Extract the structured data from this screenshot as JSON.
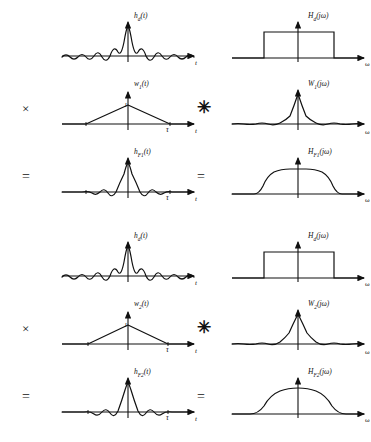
{
  "figure": {
    "domain_labels": {
      "time_axis": "t",
      "freq_axis": "ω",
      "window_duration_tick": "τ",
      "unit_amplitude": "1"
    },
    "operators": {
      "multiply": "×",
      "convolve": "✳",
      "equals": "="
    },
    "colors": {
      "background": "#ffffff",
      "curve": "#111111",
      "axis": "#111111",
      "text": "#111111"
    }
  },
  "blocks": [
    {
      "id": "block-1",
      "name": "window-1-long-duration",
      "rows": [
        {
          "id": "row-1-ideal",
          "operator_left": "",
          "operator_right": "",
          "left": {
            "label": "h",
            "label_sub": "d",
            "label_tail": "(t)",
            "axis": "t",
            "plot": "sinc"
          },
          "right": {
            "label": "H",
            "label_sub": "d",
            "label_tail": "(jω)",
            "axis": "ω",
            "plot": "ideal-brickwall"
          }
        },
        {
          "id": "row-2-window",
          "operator_left": "×",
          "operator_right": "✳",
          "left": {
            "label": "w",
            "label_sub": "1",
            "label_tail": "(t)",
            "axis": "t",
            "tick": "τ",
            "amplitude_label": "1",
            "plot": "triangular-window-wide"
          },
          "right": {
            "label": "W",
            "label_sub": "1",
            "label_tail": "(jω)",
            "axis": "ω",
            "plot": "window-spectrum-narrow"
          }
        },
        {
          "id": "row-3-result",
          "operator_left": "=",
          "operator_right": "=",
          "left": {
            "label": "h",
            "label_sub": "F1",
            "label_tail": "(t)",
            "axis": "t",
            "tick": "τ",
            "plot": "truncated-sinc-wide"
          },
          "right": {
            "label": "H",
            "label_sub": "F1",
            "label_tail": "(jω)",
            "axis": "ω",
            "plot": "smoothed-brickwall-sharp"
          }
        }
      ]
    },
    {
      "id": "block-2",
      "name": "window-2-short-duration",
      "rows": [
        {
          "id": "row-1-ideal",
          "operator_left": "",
          "operator_right": "",
          "left": {
            "label": "h",
            "label_sub": "d",
            "label_tail": "(t)",
            "axis": "t",
            "plot": "sinc"
          },
          "right": {
            "label": "H",
            "label_sub": "d",
            "label_tail": "(jω)",
            "axis": "ω",
            "plot": "ideal-brickwall"
          }
        },
        {
          "id": "row-2-window",
          "operator_left": "×",
          "operator_right": "✳",
          "left": {
            "label": "w",
            "label_sub": "2",
            "label_tail": "(t)",
            "axis": "t",
            "tick": "τ",
            "amplitude_label": "1",
            "plot": "triangular-window-narrow"
          },
          "right": {
            "label": "W",
            "label_sub": "2",
            "label_tail": "(jω)",
            "axis": "ω",
            "plot": "window-spectrum-wide"
          }
        },
        {
          "id": "row-3-result",
          "operator_left": "=",
          "operator_right": "=",
          "left": {
            "label": "h",
            "label_sub": "F2",
            "label_tail": "(t)",
            "axis": "t",
            "tick": "τ",
            "plot": "truncated-sinc-narrow"
          },
          "right": {
            "label": "H",
            "label_sub": "F2",
            "label_tail": "(jω)",
            "axis": "ω",
            "plot": "smoothed-brickwall-rounded"
          }
        }
      ]
    }
  ]
}
